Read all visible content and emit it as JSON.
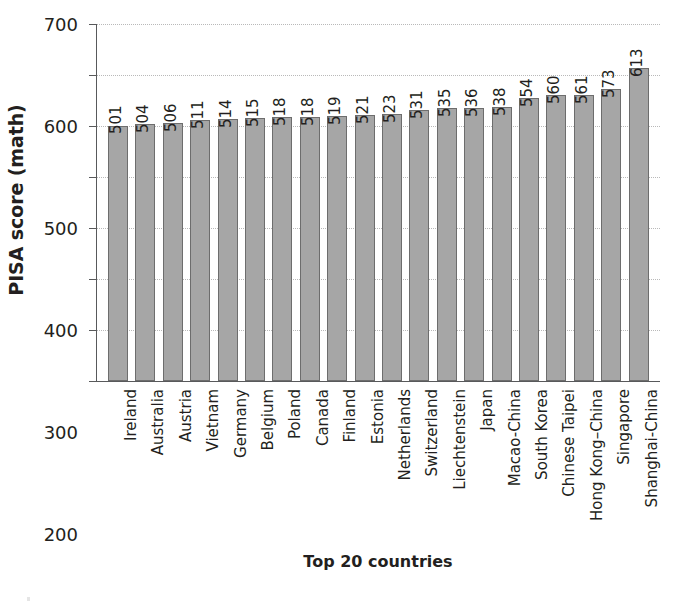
{
  "chart_data": {
    "type": "bar",
    "title": "",
    "xlabel": "Top 20 countries",
    "ylabel": "PISA score (math)",
    "ylim": [
      0,
      700
    ],
    "yticks": [
      0,
      100,
      200,
      300,
      400,
      500,
      600,
      700
    ],
    "ytick_labels": [
      "0",
      "100",
      "200",
      "300",
      "400",
      "500",
      "600",
      "700"
    ],
    "grid": true,
    "legend": "none",
    "bar_color": "#a6a6a6",
    "bar_edge_color": "#6d6d6d",
    "value_labels_rotated": true,
    "categories": [
      "Ireland",
      "Australia",
      "Austria",
      "Vietnam",
      "Germany",
      "Belgium",
      "Poland",
      "Canada",
      "Finland",
      "Estonia",
      "Netherlands",
      "Switzerland",
      "Liechtenstein",
      "Japan",
      "Macao-China",
      "South Korea",
      "Chinese Taipei",
      "Hong Kong–China",
      "Singapore",
      "Shanghai-China"
    ],
    "values": [
      501,
      504,
      506,
      511,
      514,
      515,
      518,
      518,
      519,
      521,
      523,
      531,
      535,
      536,
      538,
      554,
      560,
      561,
      573,
      613
    ],
    "value_labels": [
      "501",
      "504",
      "506",
      "511",
      "514",
      "515",
      "518",
      "518",
      "519",
      "521",
      "523",
      "531",
      "535",
      "536",
      "538",
      "554",
      "560",
      "561",
      "573",
      "613"
    ]
  }
}
